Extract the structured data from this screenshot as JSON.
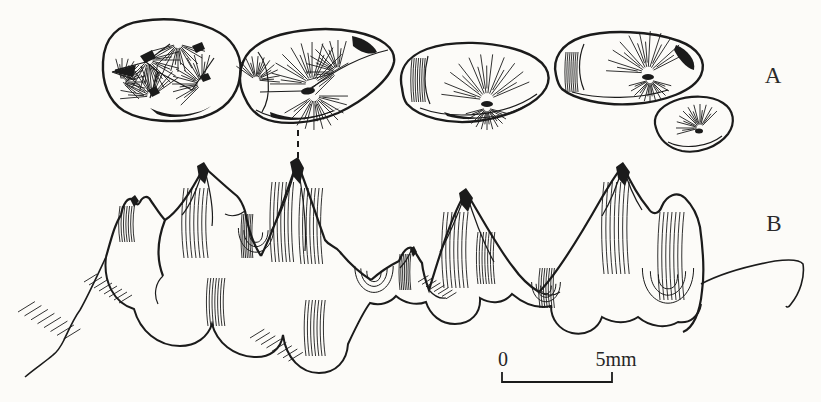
{
  "figure": {
    "panels": [
      {
        "label": "A"
      },
      {
        "label": "B"
      }
    ],
    "scale_bar": {
      "start": "0",
      "end": "5mm"
    },
    "colors": {
      "ink": "#1b1b1b",
      "background": "#fcfbf8"
    }
  }
}
